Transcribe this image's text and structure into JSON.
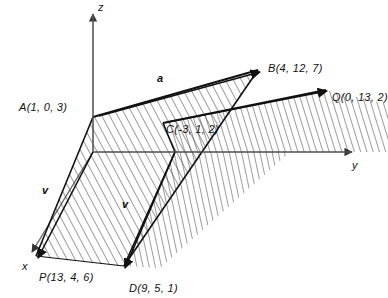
{
  "figure": {
    "background_color": "#ffffff",
    "line_color": "#111111",
    "axis_color": "#555555",
    "hatch_color": "#222222"
  },
  "axes": [
    {
      "name": "x-axis",
      "label": "x",
      "label_x": 22,
      "label_y": 261
    },
    {
      "name": "y-axis",
      "label": "y",
      "label_x": 352,
      "label_y": 160
    },
    {
      "name": "z-axis",
      "label": "z",
      "label_x": 98,
      "label_y": 2
    }
  ],
  "points": [
    {
      "name": "point-A",
      "label": "A(1, 0, 3)",
      "label_x": 19,
      "label_y": 102,
      "px": 93,
      "py": 117
    },
    {
      "name": "point-B",
      "label": "B(4, 12, 7)",
      "label_x": 268,
      "label_y": 63,
      "px": 262,
      "py": 72
    },
    {
      "name": "point-C",
      "label": "C(-3, 1, 2)",
      "label_x": 166,
      "label_y": 124,
      "px": 163,
      "py": 123
    },
    {
      "name": "point-D",
      "label": "D(9, 5, 1)",
      "label_x": 129,
      "label_y": 283,
      "px": 124,
      "py": 272
    },
    {
      "name": "point-P",
      "label": "P(13, 4, 6)",
      "label_x": 39,
      "label_y": 272,
      "px": 36,
      "py": 261
    },
    {
      "name": "point-Q",
      "label": "Q(0, 13, 2)",
      "label_x": 332,
      "label_y": 92,
      "px": 329,
      "py": 92
    }
  ],
  "vectors": [
    {
      "name": "vector-a-label",
      "label": "a",
      "label_x": 157,
      "label_y": 73
    },
    {
      "name": "vector-v1-label",
      "label": "v",
      "label_x": 42,
      "label_y": 185
    },
    {
      "name": "vector-v2-label",
      "label": "v",
      "label_x": 122,
      "label_y": 199
    }
  ],
  "origin": {
    "x": 93,
    "y": 152
  }
}
